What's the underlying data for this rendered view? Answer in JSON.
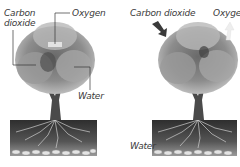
{
  "diagram": {
    "panels": [
      {
        "id": "left",
        "labels": {
          "carbon_dioxide_line1": "Carbon",
          "carbon_dioxide_line2": "dioxide",
          "oxygen": "Oxygen",
          "water": "Water"
        }
      },
      {
        "id": "right",
        "labels": {
          "carbon_dioxide": "Carbon dioxide",
          "oxygen": "Oxygen",
          "water": "Water"
        }
      }
    ],
    "colors": {
      "foliage_dark": "#5a5a5a",
      "foliage_mid": "#8c8c8c",
      "foliage_light": "#c4c4c4",
      "trunk": "#4a4a4a",
      "soil_dark": "#2e2e2e",
      "soil_light": "#9a9a9a",
      "stones": "#e0e0e0",
      "label": "#3a3a3a",
      "arrow_dark": "#3a3a3a",
      "arrow_light": "#eeeeee"
    }
  }
}
